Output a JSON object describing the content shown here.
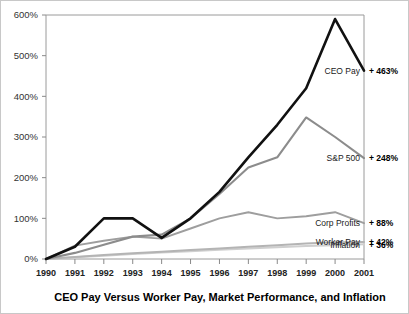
{
  "chart_data": {
    "type": "line",
    "title": "CEO Pay Versus Worker Pay, Market Performance, and Inflation",
    "xlabel": "",
    "ylabel": "",
    "ylim": [
      0,
      600
    ],
    "xlim": [
      1990,
      2001
    ],
    "grid": false,
    "legend_position": "right-inline-end-of-line",
    "yticks": [
      0,
      100,
      200,
      300,
      400,
      500,
      600
    ],
    "ytick_labels": [
      "0%",
      "100%",
      "200%",
      "300%",
      "400%",
      "500%",
      "600%"
    ],
    "categories": [
      1990,
      1991,
      1992,
      1993,
      1994,
      1995,
      1996,
      1997,
      1998,
      1999,
      2000,
      2001
    ],
    "xtick_labels": [
      "1990",
      "1991",
      "1992",
      "1993",
      "1994",
      "1995",
      "1996",
      "1997",
      "1998",
      "1999",
      "2000",
      "2001"
    ],
    "series": [
      {
        "name": "CEO Pay",
        "end_label": "CEO Pay",
        "end_value_label": "+ 463%",
        "color": "#111111",
        "width": 2.6,
        "values": [
          0,
          30,
          100,
          100,
          52,
          100,
          165,
          250,
          330,
          420,
          590,
          463
        ]
      },
      {
        "name": "S&P 500",
        "end_label": "S&P 500",
        "end_value_label": "+ 248%",
        "color": "#8c8c8c",
        "width": 2.1,
        "values": [
          0,
          15,
          35,
          55,
          60,
          100,
          160,
          225,
          250,
          348,
          300,
          248
        ]
      },
      {
        "name": "Corp Profits",
        "end_label": "Corp Profits",
        "end_value_label": "+ 88%",
        "color": "#9e9e9e",
        "width": 1.9,
        "values": [
          0,
          33,
          45,
          55,
          50,
          75,
          100,
          115,
          100,
          105,
          115,
          88
        ]
      },
      {
        "name": "Worker Pay",
        "end_label": "Worker Pay",
        "end_value_label": "+ 42%",
        "color": "#b4b4b4",
        "width": 2.0,
        "values": [
          0,
          5,
          10,
          14,
          18,
          22,
          26,
          30,
          34,
          38,
          41,
          42
        ]
      },
      {
        "name": "Inflation",
        "end_label": "Inflation",
        "end_value_label": "+ 36%",
        "color": "#cfcfcf",
        "width": 2.0,
        "values": [
          0,
          4,
          8,
          12,
          16,
          19,
          23,
          26,
          29,
          32,
          34,
          36
        ]
      }
    ]
  }
}
